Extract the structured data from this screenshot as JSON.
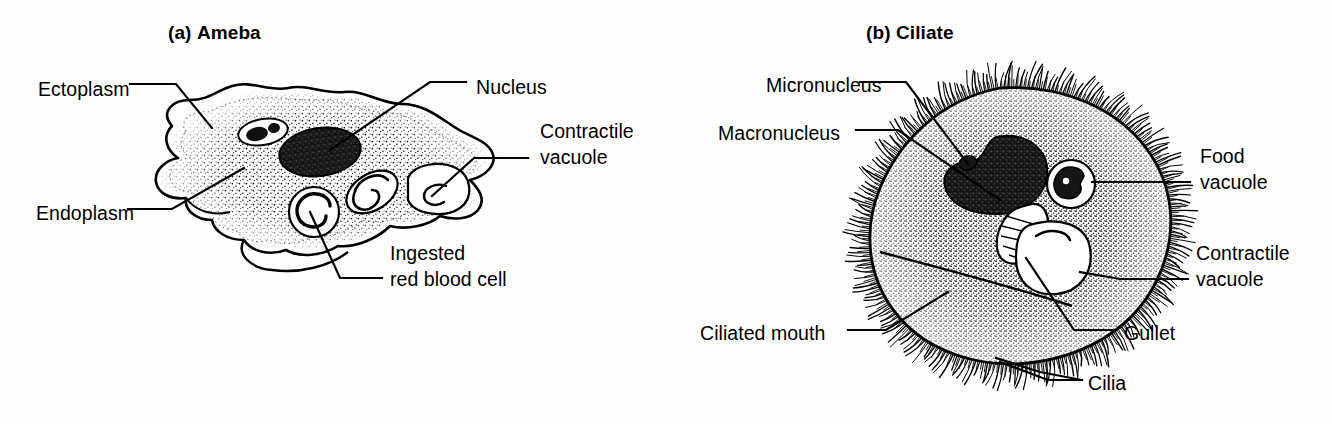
{
  "figure": {
    "domain": "biology-diagram",
    "background": "#ffffff",
    "ink": "#000000",
    "panels": [
      {
        "id": "a",
        "prefix": "(a)",
        "name": "Ameba",
        "title_x": 168,
        "title_y": 22,
        "labels": [
          {
            "key": "ectoplasm",
            "lines": [
              "Ectoplasm"
            ],
            "x": 38,
            "y": 76,
            "align": "left"
          },
          {
            "key": "endoplasm",
            "lines": [
              "Endoplasm"
            ],
            "x": 36,
            "y": 200,
            "align": "left"
          },
          {
            "key": "nucleus",
            "lines": [
              "Nucleus"
            ],
            "x": 476,
            "y": 74,
            "align": "left"
          },
          {
            "key": "contractile-vacuole",
            "lines": [
              "Contractile",
              "vacuole"
            ],
            "x": 540,
            "y": 118,
            "align": "left"
          },
          {
            "key": "ingested-red-blood-cell",
            "lines": [
              "Ingested",
              "red blood cell"
            ],
            "x": 390,
            "y": 240,
            "align": "left"
          }
        ]
      },
      {
        "id": "b",
        "prefix": "(b)",
        "name": "Ciliate",
        "title_x": 866,
        "title_y": 22,
        "labels": [
          {
            "key": "micronucleus",
            "lines": [
              "Micronucleus"
            ],
            "x": 766,
            "y": 72,
            "align": "left"
          },
          {
            "key": "macronucleus",
            "lines": [
              "Macronucleus"
            ],
            "x": 718,
            "y": 120,
            "align": "left"
          },
          {
            "key": "food-vacuole",
            "lines": [
              "Food",
              "vacuole"
            ],
            "x": 1200,
            "y": 143,
            "align": "left"
          },
          {
            "key": "contractile-vacuole",
            "lines": [
              "Contractile",
              "vacuole"
            ],
            "x": 1196,
            "y": 240,
            "align": "left"
          },
          {
            "key": "ciliated-mouth",
            "lines": [
              "Ciliated mouth"
            ],
            "x": 700,
            "y": 320,
            "align": "left"
          },
          {
            "key": "gullet",
            "lines": [
              "Gullet"
            ],
            "x": 1124,
            "y": 320,
            "align": "left"
          },
          {
            "key": "cilia",
            "lines": [
              "Cilia"
            ],
            "x": 1088,
            "y": 370,
            "align": "left"
          }
        ]
      }
    ]
  }
}
